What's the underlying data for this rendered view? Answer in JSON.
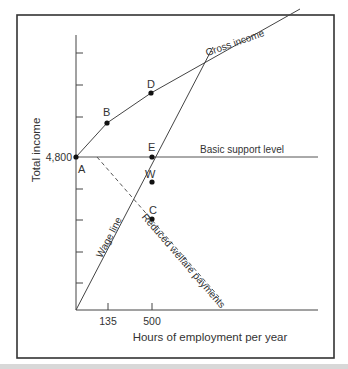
{
  "diagram": {
    "y_axis_label": "Total income",
    "x_axis_label": "Hours of employment per year",
    "y_tick_label": "4,800",
    "x_tick_labels": [
      "135",
      "500"
    ],
    "line_labels": {
      "gross_income": "Gross income",
      "basic_support": "Basic support level",
      "wage_line": "Wage line",
      "reduced_welfare": "Reduced welfare payments"
    },
    "points": [
      {
        "id": "A",
        "label": "A"
      },
      {
        "id": "B",
        "label": "B"
      },
      {
        "id": "D",
        "label": "D"
      },
      {
        "id": "E",
        "label": "E"
      },
      {
        "id": "W",
        "label": "W"
      },
      {
        "id": "C",
        "label": "C"
      }
    ],
    "colors": {
      "line": "#4a4a4a",
      "frame": "#333333",
      "point": "#111111",
      "text": "#333333"
    }
  }
}
